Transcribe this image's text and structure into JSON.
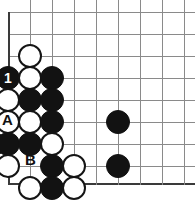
{
  "diagram": {
    "type": "go-board-problem",
    "title": "",
    "board": {
      "grid_spacing": 22,
      "line_color": "#8a8a8a",
      "edge_color": "#3a3a3a",
      "origin_x": 8,
      "origin_y": 12,
      "columns": 9,
      "rows": 9,
      "bottom_edge_y": 184,
      "left_edge_x": 8,
      "stone_radius": 12
    },
    "stones": [
      {
        "id": "w1",
        "color": "white",
        "cx": 30,
        "cy": 56,
        "label": ""
      },
      {
        "id": "b1",
        "color": "black",
        "cx": 8,
        "cy": 78,
        "label": "1"
      },
      {
        "id": "w2",
        "color": "white",
        "cx": 30,
        "cy": 78,
        "label": ""
      },
      {
        "id": "b2",
        "color": "black",
        "cx": 52,
        "cy": 78,
        "label": ""
      },
      {
        "id": "w3",
        "color": "white",
        "cx": 8,
        "cy": 100,
        "label": ""
      },
      {
        "id": "b3",
        "color": "black",
        "cx": 30,
        "cy": 100,
        "label": ""
      },
      {
        "id": "b4",
        "color": "black",
        "cx": 52,
        "cy": 100,
        "label": ""
      },
      {
        "id": "w4",
        "color": "white",
        "cx": 8,
        "cy": 122,
        "label": ""
      },
      {
        "id": "w5",
        "color": "white",
        "cx": 30,
        "cy": 122,
        "label": ""
      },
      {
        "id": "b5",
        "color": "black",
        "cx": 52,
        "cy": 122,
        "label": ""
      },
      {
        "id": "b6",
        "color": "black",
        "cx": 118,
        "cy": 122,
        "label": ""
      },
      {
        "id": "b7",
        "color": "black",
        "cx": -6,
        "cy": 144,
        "label": ""
      },
      {
        "id": "b8",
        "color": "black",
        "cx": 8,
        "cy": 144,
        "label": ""
      },
      {
        "id": "b9",
        "color": "black",
        "cx": 30,
        "cy": 144,
        "label": ""
      },
      {
        "id": "w6",
        "color": "white",
        "cx": 52,
        "cy": 144,
        "label": ""
      },
      {
        "id": "w7",
        "color": "white",
        "cx": 8,
        "cy": 166,
        "label": ""
      },
      {
        "id": "b10",
        "color": "black",
        "cx": 52,
        "cy": 166,
        "label": ""
      },
      {
        "id": "w8",
        "color": "white",
        "cx": 74,
        "cy": 166,
        "label": ""
      },
      {
        "id": "b11",
        "color": "black",
        "cx": 118,
        "cy": 166,
        "label": ""
      },
      {
        "id": "w9",
        "color": "white",
        "cx": 30,
        "cy": 188,
        "label": ""
      },
      {
        "id": "b12",
        "color": "black",
        "cx": 52,
        "cy": 188,
        "label": ""
      },
      {
        "id": "w10",
        "color": "white",
        "cx": 74,
        "cy": 188,
        "label": ""
      }
    ],
    "point_labels": [
      {
        "id": "label-a",
        "text": "A",
        "x": 2,
        "y": 112
      },
      {
        "id": "label-b",
        "text": "B",
        "x": 25,
        "y": 152
      }
    ],
    "move_numbers": [
      "1"
    ]
  }
}
